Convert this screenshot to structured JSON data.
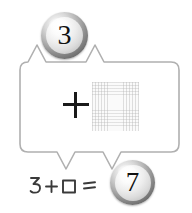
{
  "canvas": {
    "width": 192,
    "height": 213,
    "background": "#ffffff"
  },
  "bubble": {
    "name": "rounded-callout-box",
    "stroke_color": "#b0b0b0",
    "fill_color": "#ffffff",
    "top_notch_points_to": "top-number-sphere",
    "bottom_notch_points_to": "bottom-number-sphere"
  },
  "spheres": {
    "top": {
      "value": "3",
      "style": "glossy-silver-sphere",
      "text_color": "#111111"
    },
    "bottom": {
      "value": "7",
      "style": "glossy-silver-sphere",
      "text_color": "#111111"
    }
  },
  "box_contents": {
    "operator": "+",
    "operator_color": "#1a1a1a",
    "grid_square": {
      "label": "faint-graph-paper-square",
      "line_color": "#b2b2b2",
      "fill_color": "#fafafa"
    }
  },
  "equation": {
    "text": "3+□=",
    "parts": [
      "3",
      "+",
      "□",
      "="
    ],
    "style": "handwritten",
    "ink_color": "#3a3a3a"
  }
}
